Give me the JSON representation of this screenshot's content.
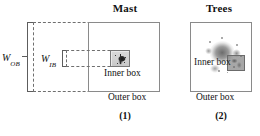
{
  "figure": {
    "panels": [
      {
        "id": "panel-1",
        "title": "Mast",
        "number": "(1)",
        "inner_box_label": "Inner box",
        "outer_box_label": "Outer box",
        "measures": [
          {
            "name": "W_OB",
            "symbol": "W",
            "subscript": "OB",
            "target": "outer box width"
          },
          {
            "name": "W_IB",
            "symbol": "W",
            "subscript": "IB",
            "target": "inner box width"
          }
        ]
      },
      {
        "id": "panel-2",
        "title": "Trees",
        "number": "(2)",
        "inner_box_label": "Inner box",
        "outer_box_label": "Outer box",
        "measures": []
      }
    ]
  },
  "colors": {
    "stroke_solid": "#8a8a8a",
    "stroke_dashed": "#6f6f6f",
    "text": "#111111",
    "background": "#ffffff",
    "blob_gray": "#787878"
  }
}
